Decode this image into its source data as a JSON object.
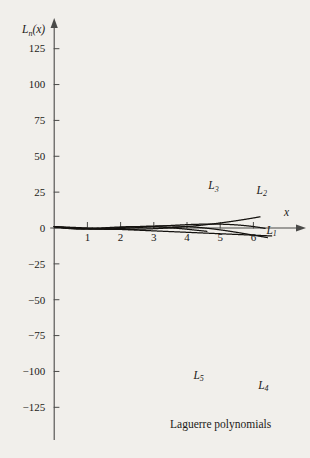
{
  "figure": {
    "caption": "Laguerre polynomials",
    "y_axis_title": "L",
    "y_axis_title_sub": "n",
    "y_axis_title_tail": "(x)",
    "x_axis_title": "x",
    "background_color": "#f1efeb",
    "curve_color": "#14120f",
    "axis_color": "#4a4a48"
  },
  "chart_data": {
    "type": "line",
    "title": "Laguerre polynomials",
    "xlabel": "x",
    "ylabel": "L_n(x)",
    "xlim": [
      -0.15,
      6.8
    ],
    "ylim": [
      -132,
      140
    ],
    "grid": false,
    "legend": "inline-curve-labels",
    "x_ticks": [
      1,
      2,
      3,
      4,
      5,
      6
    ],
    "x_tick_labels": [
      "1",
      "2",
      "3",
      "4",
      "5",
      "6"
    ],
    "y_ticks": [
      125,
      100,
      75,
      50,
      25,
      0,
      -25,
      -50,
      -75,
      -100,
      -125
    ],
    "y_tick_labels": [
      "125",
      "100",
      "75",
      "50",
      "25",
      "0",
      "−25",
      "−50",
      "−75",
      "−100",
      "−125"
    ],
    "series": [
      {
        "name": "L1",
        "label": "L",
        "label_sub": "1",
        "label_x": 6.55,
        "label_y": -4,
        "formula": "1 - x",
        "coeffs": [
          1,
          -1
        ],
        "x_start": 0,
        "x_end": 6.55
      },
      {
        "name": "L2",
        "label": "L",
        "label_sub": "2",
        "label_x": 6.25,
        "label_y": 24,
        "formula": "1 - 2x + x^2/2",
        "coeffs": [
          1,
          -2,
          0.5
        ],
        "x_start": 0,
        "x_end": 6.2
      },
      {
        "name": "L3",
        "label": "L",
        "label_sub": "3",
        "label_x": 4.8,
        "label_y": 27,
        "formula": "1 - 3x + 1.5x^2 - x^3/6",
        "coeffs": [
          1,
          -3,
          1.5,
          -0.16666667
        ],
        "x_start": 0,
        "x_end": 6.35
      },
      {
        "name": "L4",
        "label": "L",
        "label_sub": "4",
        "label_x": 6.3,
        "label_y": -112,
        "formula": "1 - 4x + 3x^2 - (2/3)x^3 + x^4/24",
        "coeffs": [
          1,
          -4,
          3,
          -0.66666667,
          0.04166667
        ],
        "x_start": 0,
        "x_end": 6.42
      },
      {
        "name": "L5",
        "label": "L",
        "label_sub": "5",
        "label_x": 4.35,
        "label_y": -105,
        "formula": "1 - 5x + 5x^2 - (5/3)x^3 + (5/24)x^4 - x^5/120",
        "coeffs": [
          1,
          -5,
          5,
          -1.6666667,
          0.20833333,
          -0.00833333
        ],
        "x_start": 0,
        "x_end": 4.6
      }
    ],
    "annotations": [
      {
        "text": "peak of L5 near x = 2.6, y ≈ 127"
      },
      {
        "text": "L4 minimum near x = 1.1, y ≈ -68"
      },
      {
        "text": "L3 maximum near x = 3.2, y ≈ 35"
      }
    ]
  }
}
